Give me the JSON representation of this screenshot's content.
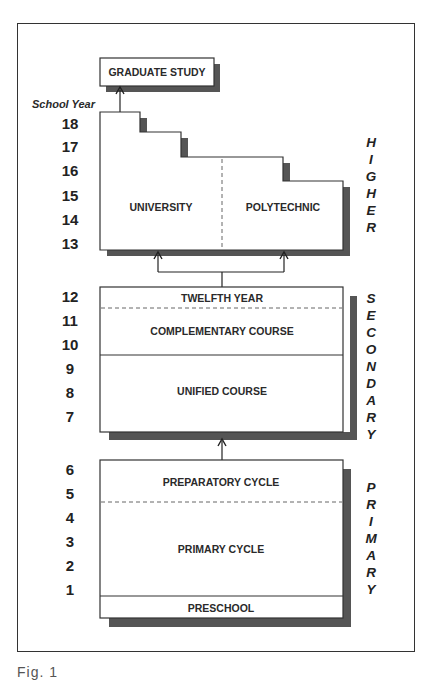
{
  "diagram": {
    "axis_title": "School Year",
    "years": [
      "18",
      "17",
      "16",
      "15",
      "14",
      "13",
      "12",
      "11",
      "10",
      "9",
      "8",
      "7",
      "6",
      "5",
      "4",
      "3",
      "2",
      "1"
    ],
    "graduate": {
      "label": "GRADUATE STUDY"
    },
    "higher": {
      "side_label": [
        "H",
        "I",
        "G",
        "H",
        "E",
        "R"
      ],
      "left": {
        "label": "UNIVERSITY"
      },
      "right": {
        "label": "POLYTECHNIC"
      }
    },
    "secondary": {
      "side_label": [
        "S",
        "E",
        "C",
        "O",
        "N",
        "D",
        "A",
        "R",
        "Y"
      ],
      "twelfth": {
        "label": "TWELFTH YEAR"
      },
      "complementary": {
        "label": "COMPLEMENTARY COURSE"
      },
      "unified": {
        "label": "UNIFIED COURSE"
      }
    },
    "primary": {
      "side_label": [
        "P",
        "R",
        "I",
        "M",
        "A",
        "R",
        "Y"
      ],
      "preparatory": {
        "label": "PREPARATORY CYCLE"
      },
      "primary_cycle": {
        "label": "PRIMARY CYCLE"
      },
      "preschool": {
        "label": "PRESCHOOL"
      }
    },
    "caption": "Fig.   1"
  },
  "colors": {
    "line": "#333333",
    "shadow": "#555555",
    "fill": "#ffffff",
    "text": "#2a2a2a"
  }
}
